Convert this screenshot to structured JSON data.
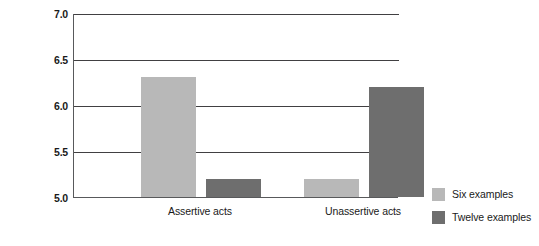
{
  "chart_data": {
    "type": "bar",
    "title": "",
    "xlabel": "",
    "ylabel": "Self-rated assertiveness",
    "categories": [
      "Assertive acts",
      "Unassertive acts"
    ],
    "series": [
      {
        "name": "Six examples",
        "color": "#b8b8b8",
        "values": [
          6.3,
          5.2
        ]
      },
      {
        "name": "Twelve examples",
        "color": "#6e6e6e",
        "values": [
          5.2,
          6.2
        ]
      }
    ],
    "ylim": [
      5.0,
      7.0
    ],
    "yticks": [
      "5.0",
      "5.5",
      "6.0",
      "6.5",
      "7.0"
    ],
    "ytick_values": [
      5.0,
      5.5,
      6.0,
      6.5,
      7.0
    ],
    "grid": true,
    "legend_position": "right"
  },
  "legend": {
    "items": [
      {
        "label": "Six examples",
        "swatch": "light-gray-swatch"
      },
      {
        "label": "Twelve examples",
        "swatch": "dark-gray-swatch"
      }
    ]
  }
}
